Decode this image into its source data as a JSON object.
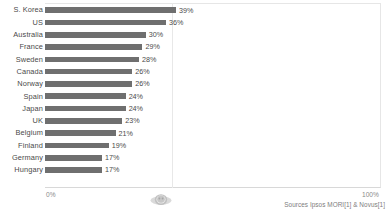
{
  "chart_data": {
    "type": "bar",
    "orientation": "horizontal",
    "title": "",
    "xlabel": "",
    "ylabel": "",
    "xlim": [
      0,
      100
    ],
    "grid": true,
    "gridlines_at": [
      50
    ],
    "legend": "none",
    "axis_ticks": [
      "0%",
      "100%"
    ],
    "categories": [
      "S. Korea",
      "US",
      "Australia",
      "France",
      "Sweden",
      "Canada",
      "Norway",
      "Spain",
      "Japan",
      "UK",
      "Belgium",
      "Finland",
      "Germany",
      "Hungary"
    ],
    "values": [
      39,
      36,
      30,
      29,
      28,
      26,
      26,
      24,
      24,
      23,
      21,
      19,
      17,
      17
    ],
    "value_labels": [
      "39%",
      "36%",
      "30%",
      "29%",
      "28%",
      "26%",
      "26%",
      "24%",
      "24%",
      "23%",
      "21%",
      "19%",
      "17%",
      "17%"
    ],
    "bar_color": "#6f6f6f",
    "label_color": "#4a4a4a",
    "gridline_color": "#e8e8e8"
  },
  "axis": {
    "min_label": "0%",
    "max_label": "100%"
  },
  "footer": {
    "source_note": "Sources Ipsos MORI[1] & Novus[1]"
  },
  "watermark": {
    "name": "emblem-watermark"
  }
}
